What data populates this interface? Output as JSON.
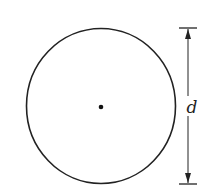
{
  "diagram": {
    "shape": "circle",
    "center_marker": "center-point",
    "dimension": {
      "label": "d",
      "meaning": "diameter"
    },
    "colors": {
      "stroke": "#222222",
      "background": "#ffffff"
    }
  }
}
